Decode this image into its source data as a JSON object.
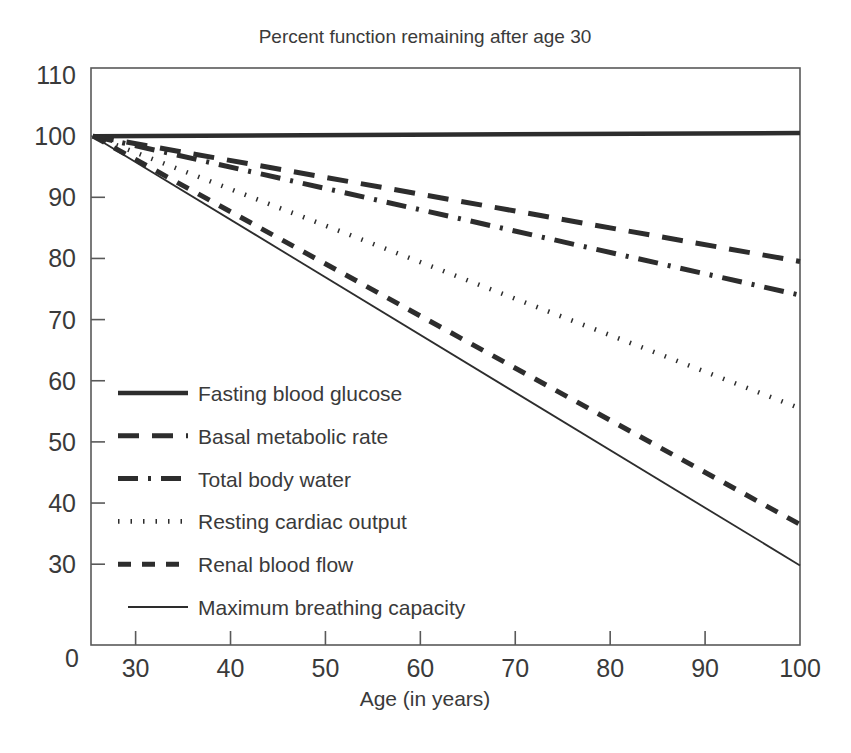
{
  "chart_data": {
    "type": "line",
    "title": "Percent function remaining after age 30",
    "xlabel": "Age (in years)",
    "ylabel": "",
    "xlim": [
      25.3,
      100
    ],
    "ylim": [
      23,
      110
    ],
    "grid": false,
    "legend_position": "inside-lower-left",
    "x_ticks": [
      "30",
      "40",
      "50",
      "60",
      "70",
      "80",
      "90",
      "100"
    ],
    "x_tick_values": [
      30,
      40,
      50,
      60,
      70,
      80,
      90,
      100
    ],
    "y_ticks": [
      "110",
      "100",
      "90",
      "80",
      "70",
      "60",
      "50",
      "40",
      "30",
      "0"
    ],
    "y_tick_values": [
      110,
      100,
      90,
      80,
      70,
      60,
      50,
      40,
      30,
      0
    ],
    "origin_label": "0",
    "x": [
      30,
      100
    ],
    "series": [
      {
        "name": "Fasting blood glucose",
        "dash": "solid-thick",
        "values": [
          100,
          100.5
        ]
      },
      {
        "name": "Basal metabolic rate",
        "dash": "long-dash",
        "values": [
          99.5,
          79.5
        ]
      },
      {
        "name": "Total body water",
        "dash": "dash-dot",
        "values": [
          99.0,
          74.0
        ]
      },
      {
        "name": "Resting cardiac output",
        "dash": "dotted",
        "values": [
          98.5,
          55.5
        ]
      },
      {
        "name": "Renal blood flow",
        "dash": "short-dash",
        "values": [
          98.0,
          36.5
        ]
      },
      {
        "name": "Maximum breathing capacity",
        "dash": "solid-thin",
        "values": [
          97.5,
          29.8
        ]
      }
    ]
  },
  "legend": {
    "items": [
      {
        "label": "Fasting blood glucose",
        "style": "solid-thick"
      },
      {
        "label": "Basal metabolic rate",
        "style": "long-dash"
      },
      {
        "label": "Total body water",
        "style": "dash-dot"
      },
      {
        "label": "Resting cardiac output",
        "style": "dotted"
      },
      {
        "label": "Renal blood flow",
        "style": "short-dash"
      },
      {
        "label": "Maximum breathing capacity",
        "style": "solid-thin"
      }
    ]
  },
  "colors": {
    "line": "#2d2d2d",
    "axis": "#595959",
    "text": "#3a3a3a",
    "background": "#ffffff"
  }
}
